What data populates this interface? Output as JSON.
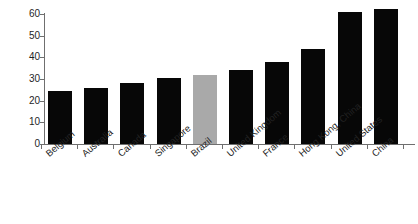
{
  "chart_data": {
    "type": "bar",
    "title": "",
    "subtitle": "",
    "xlabel": "",
    "ylabel": "",
    "ylim": [
      0,
      60
    ],
    "yticks": [
      0,
      10,
      20,
      30,
      40,
      50,
      60
    ],
    "grid": false,
    "legend": "none",
    "categories": [
      "Belgium",
      "Australia",
      "Canada",
      "Singapore",
      "Brazil",
      "United Kingdom",
      "France",
      "Hong Kong, China",
      "United States",
      "China"
    ],
    "values": [
      24.5,
      26,
      28,
      30.5,
      32,
      34,
      38,
      44,
      61,
      62.5
    ],
    "bar_colors": [
      "#070707",
      "#070707",
      "#070707",
      "#070707",
      "#a9a9a9",
      "#070707",
      "#070707",
      "#070707",
      "#070707",
      "#070707"
    ],
    "highlight_category": "Brazil",
    "axis_color": "#6f6f6f",
    "background": "#ffffff"
  }
}
